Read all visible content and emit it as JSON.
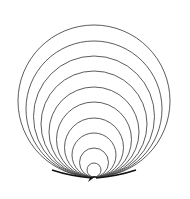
{
  "diagram": {
    "stroke_color": "#4a4a4a",
    "tail_color": "#111111",
    "tangent_point": {
      "x": 94,
      "y": 177
    },
    "circles": [
      {
        "cx": 94,
        "cy": 101,
        "r": 76
      },
      {
        "cx": 94,
        "cy": 109,
        "r": 68
      },
      {
        "cx": 94,
        "cy": 116.5,
        "r": 60.5
      },
      {
        "cx": 94,
        "cy": 124,
        "r": 53
      },
      {
        "cx": 94,
        "cy": 132,
        "r": 45
      },
      {
        "cx": 94,
        "cy": 139.5,
        "r": 37.5
      },
      {
        "cx": 94,
        "cy": 147.5,
        "r": 29.5
      },
      {
        "cx": 94,
        "cy": 155,
        "r": 22
      },
      {
        "cx": 94,
        "cy": 162.5,
        "r": 14.5
      },
      {
        "cx": 94,
        "cy": 170,
        "r": 7
      }
    ]
  }
}
